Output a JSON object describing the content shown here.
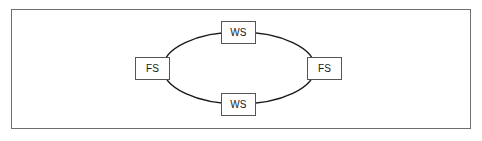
{
  "figure": {
    "type": "network-ring-topology-diagram",
    "frame": {
      "border_color": "#6e6e6e"
    },
    "ring": {
      "shape": "ellipse",
      "center_x": 239,
      "center_y": 68,
      "radius_x": 76,
      "radius_y": 36,
      "stroke_color": "#1a1a1a",
      "stroke_width": 1.4
    },
    "nodes": [
      {
        "id": "ws-top",
        "label": "WS",
        "role": "workstation",
        "position": "top"
      },
      {
        "id": "fs-left",
        "label": "FS",
        "role": "file-server",
        "position": "left"
      },
      {
        "id": "fs-right",
        "label": "FS",
        "role": "file-server",
        "position": "right"
      },
      {
        "id": "ws-bottom",
        "label": "WS",
        "role": "workstation",
        "position": "bottom"
      }
    ]
  }
}
